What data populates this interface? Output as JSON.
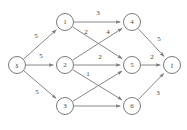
{
  "diagram": {
    "type": "directed-weighted-graph",
    "colors": {
      "background": "#ffffff",
      "node_stroke": "#6b6b6b",
      "node_fill": "#ffffff",
      "edge_stroke": "#7a7a7a",
      "label_text": "#4a4a4a",
      "weight_text": "#3f3f3f"
    },
    "nodes": [
      {
        "id": "s",
        "label": "s",
        "x": 17,
        "y": 65,
        "r": 8.5,
        "terminal": true
      },
      {
        "id": "1",
        "label": "1",
        "x": 65,
        "y": 22,
        "r": 8.5,
        "terminal": false
      },
      {
        "id": "2",
        "label": "2",
        "x": 65,
        "y": 65,
        "r": 8.5,
        "terminal": false
      },
      {
        "id": "3",
        "label": "3",
        "x": 65,
        "y": 106,
        "r": 8.5,
        "terminal": false
      },
      {
        "id": "4",
        "label": "4",
        "x": 132,
        "y": 22,
        "r": 8.5,
        "terminal": false
      },
      {
        "id": "5",
        "label": "5",
        "x": 132,
        "y": 65,
        "r": 8.5,
        "terminal": false
      },
      {
        "id": "6",
        "label": "6",
        "x": 132,
        "y": 106,
        "r": 8.5,
        "terminal": false
      },
      {
        "id": "t",
        "label": "t",
        "x": 172,
        "y": 65,
        "r": 8.5,
        "terminal": true
      }
    ],
    "edges": [
      {
        "from": "s",
        "to": "1",
        "weight": "5",
        "wx": 36,
        "wy": 36
      },
      {
        "from": "s",
        "to": "2",
        "weight": "5",
        "wx": 41,
        "wy": 56
      },
      {
        "from": "s",
        "to": "3",
        "weight": "5",
        "wx": 37,
        "wy": 92
      },
      {
        "from": "1",
        "to": "4",
        "weight": "3",
        "wx": 98,
        "wy": 13
      },
      {
        "from": "1",
        "to": "5",
        "weight": "2",
        "wx": 86,
        "wy": 32
      },
      {
        "from": "2",
        "to": "4",
        "weight": "4",
        "wx": 108,
        "wy": 32
      },
      {
        "from": "2",
        "to": "5",
        "weight": "2",
        "wx": 100,
        "wy": 57
      },
      {
        "from": "2",
        "to": "6",
        "weight": "",
        "wx": 0,
        "wy": 0
      },
      {
        "from": "3",
        "to": "5",
        "weight": "1",
        "wx": 88,
        "wy": 74
      },
      {
        "from": "3",
        "to": "6",
        "weight": "",
        "wx": 0,
        "wy": 0
      },
      {
        "from": "4",
        "to": "t",
        "weight": "5",
        "wx": 159,
        "wy": 39
      },
      {
        "from": "5",
        "to": "t",
        "weight": "2",
        "wx": 152,
        "wy": 57
      },
      {
        "from": "6",
        "to": "t",
        "weight": "3",
        "wx": 158,
        "wy": 93
      }
    ]
  }
}
